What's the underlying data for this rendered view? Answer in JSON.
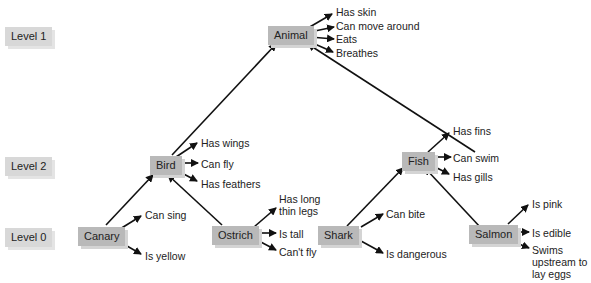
{
  "levels": [
    {
      "label": "Level 1"
    },
    {
      "label": "Level 2"
    },
    {
      "label": "Level 0"
    }
  ],
  "nodes": {
    "animal": {
      "label": "Animal",
      "properties": [
        "Has skin",
        "Can move around",
        "Eats",
        "Breathes"
      ]
    },
    "bird": {
      "label": "Bird",
      "properties": [
        "Has wings",
        "Can fly",
        "Has feathers"
      ]
    },
    "fish": {
      "label": "Fish",
      "properties": [
        "Has fins",
        "Can swim",
        "Has gills"
      ]
    },
    "canary": {
      "label": "Canary",
      "properties": [
        "Can sing",
        "Is yellow"
      ]
    },
    "ostrich": {
      "label": "Ostrich",
      "properties": [
        "Has long thin legs",
        "Is tall",
        "Can't fly"
      ]
    },
    "shark": {
      "label": "Shark",
      "properties": [
        "Can bite",
        "Is dangerous"
      ]
    },
    "salmon": {
      "label": "Salmon",
      "properties": [
        "Is pink",
        "Is edible",
        "Swims upstream to lay eggs"
      ]
    }
  },
  "colors": {
    "node": "#b9b9b9",
    "level": "#d8d8d8",
    "arrow": "#111111"
  }
}
